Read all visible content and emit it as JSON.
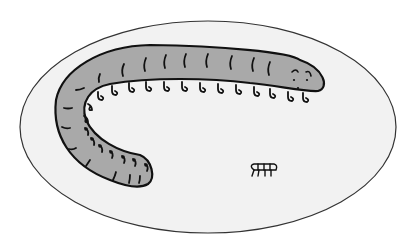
{
  "scene": {
    "description": "Line illustration of a large segmented worm-like creature with many small hooked legs inside an oval dish, and a tiny segmented organism in the lower right",
    "colors": {
      "background": "#ffffff",
      "dish_fill": "#f2f2f2",
      "dish_stroke": "#333333",
      "body_fill": "#a9a9a9",
      "ink": "#111111"
    },
    "elements": {
      "dish": "oval-dish",
      "creature": "segmented-worm",
      "small_organism": "small-segmented-organism"
    }
  }
}
